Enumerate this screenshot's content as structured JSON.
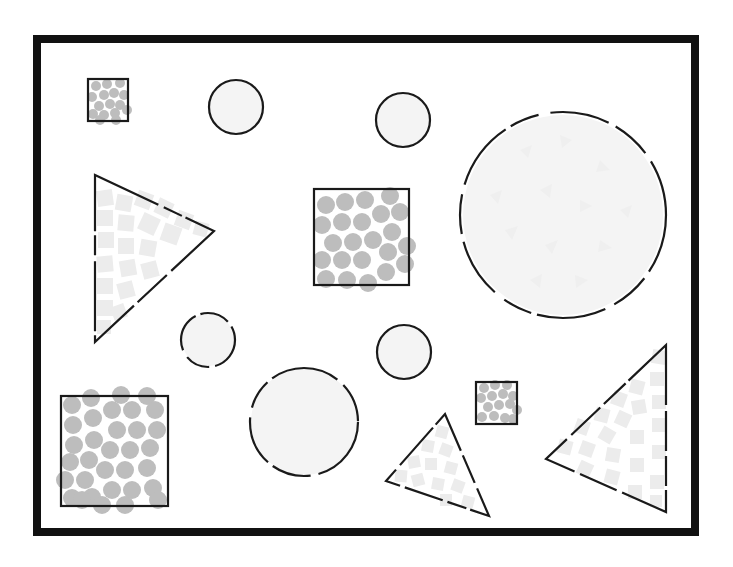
{
  "diagram": {
    "colors": {
      "frame": "#111111",
      "outline": "#1a1a1a",
      "circle_fill": "#bdbdbd",
      "square_fill": "#ececec",
      "background": "#ffffff"
    },
    "frame": {
      "x": 37,
      "y": 39,
      "w": 658,
      "h": 493
    },
    "shapes": [
      {
        "id": "square-small-top-left",
        "type": "square",
        "x": 88,
        "y": 79,
        "size": 40,
        "outline": "solid",
        "fill": "circles",
        "fill_count": 16
      },
      {
        "id": "circle-top-1",
        "type": "circle",
        "cx": 236,
        "cy": 107,
        "r": 27,
        "outline": "solid"
      },
      {
        "id": "circle-top-2",
        "type": "circle",
        "cx": 403,
        "cy": 120,
        "r": 27,
        "outline": "solid"
      },
      {
        "id": "circle-large-right",
        "type": "circle",
        "cx": 563,
        "cy": 215,
        "r": 103,
        "outline": "dashed"
      },
      {
        "id": "triangle-left",
        "type": "triangle",
        "points": [
          [
            95,
            175
          ],
          [
            214,
            231
          ],
          [
            95,
            342
          ]
        ],
        "outline": "dashed",
        "fill": "squares"
      },
      {
        "id": "square-center",
        "type": "square",
        "x": 314,
        "y": 189,
        "size": 96,
        "outline": "solid",
        "fill": "circles",
        "fill_count": 25
      },
      {
        "id": "circle-dashed-small",
        "type": "circle",
        "cx": 208,
        "cy": 340,
        "r": 27,
        "outline": "dashed"
      },
      {
        "id": "circle-middle",
        "type": "circle",
        "cx": 404,
        "cy": 352,
        "r": 27,
        "outline": "solid"
      },
      {
        "id": "square-bottom-left",
        "type": "square",
        "x": 61,
        "y": 396,
        "size": 106,
        "outline": "solid",
        "fill": "circles",
        "fill_count": 38
      },
      {
        "id": "circle-dashed-bottom",
        "type": "circle",
        "cx": 304,
        "cy": 422,
        "r": 54,
        "outline": "dashed"
      },
      {
        "id": "square-small-bottom",
        "type": "square",
        "x": 476,
        "y": 382,
        "size": 41,
        "outline": "solid",
        "fill": "circles",
        "fill_count": 15
      },
      {
        "id": "triangle-bottom-center",
        "type": "triangle",
        "points": [
          [
            445,
            414
          ],
          [
            489,
            516
          ],
          [
            386,
            481
          ]
        ],
        "outline": "dashed",
        "fill": "squares"
      },
      {
        "id": "triangle-bottom-right",
        "type": "triangle",
        "points": [
          [
            666,
            345
          ],
          [
            666,
            512
          ],
          [
            546,
            459
          ]
        ],
        "outline": "dashed",
        "fill": "squares"
      }
    ]
  }
}
